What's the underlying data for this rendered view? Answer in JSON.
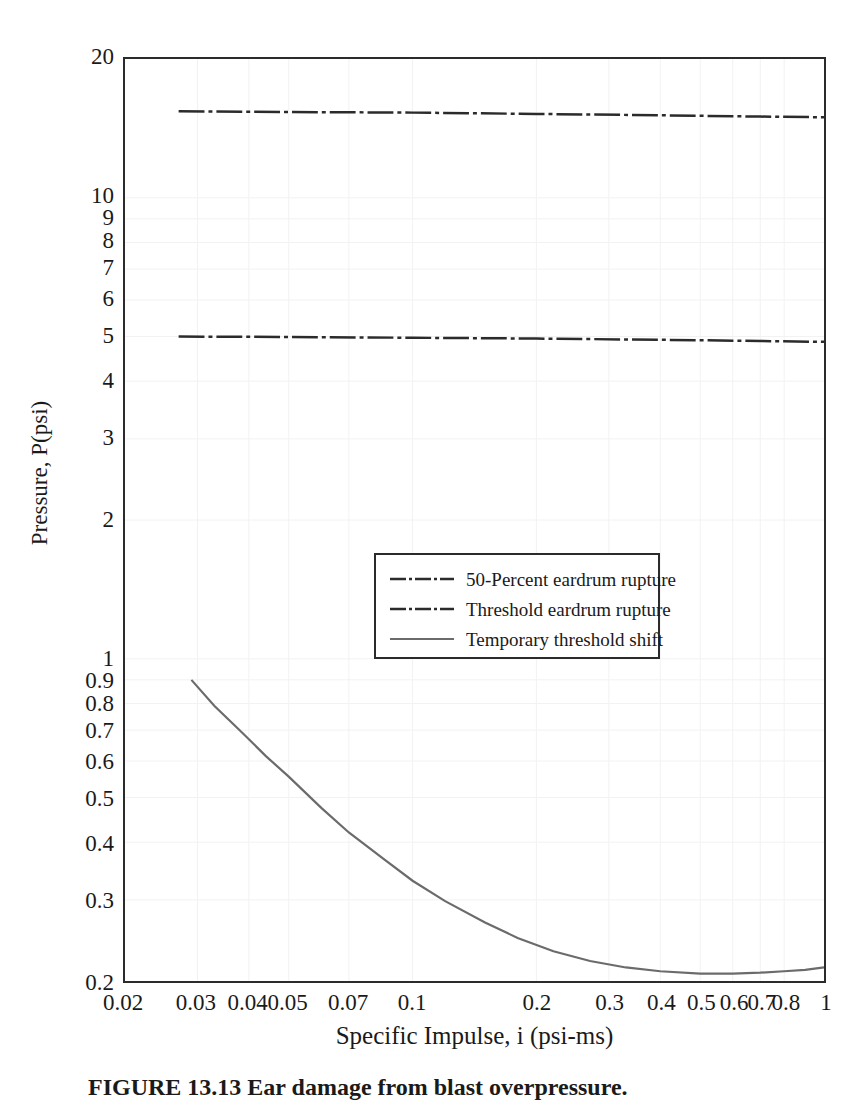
{
  "figure": {
    "caption": "FIGURE 13.13  Ear damage from blast overpressure."
  },
  "chart_data": {
    "type": "line",
    "title": "",
    "xlabel": "Specific Impulse, i (psi-ms)",
    "ylabel": "Pressure, P(psi)",
    "xscale": "log",
    "yscale": "log",
    "xlim": [
      0.02,
      1
    ],
    "ylim": [
      0.2,
      20
    ],
    "grid": true,
    "legend_position": "center",
    "xticks": [
      "0.02",
      "0.03",
      "0.04",
      "0.05",
      "0.07",
      "0.1",
      "0.2",
      "0.3",
      "0.4",
      "0.5",
      "0.6",
      "0.7",
      "0.8",
      "1"
    ],
    "xtick_values": [
      0.02,
      0.03,
      0.04,
      0.05,
      0.07,
      0.1,
      0.2,
      0.3,
      0.4,
      0.5,
      0.6,
      0.7,
      0.8,
      1
    ],
    "yticks": [
      "20",
      "10",
      "9",
      "8",
      "7",
      "6",
      "5",
      "4",
      "3",
      "2",
      "1",
      "0.9",
      "0.8",
      "0.7",
      "0.6",
      "0.5",
      "0.4",
      "0.3",
      "0.2"
    ],
    "ytick_values": [
      20,
      10,
      9,
      8,
      7,
      6,
      5,
      4,
      3,
      2,
      1,
      0.9,
      0.8,
      0.7,
      0.6,
      0.5,
      0.4,
      0.3,
      0.2
    ],
    "series": [
      {
        "name": "50-Percent eardrum rupture",
        "style": "dash-dot",
        "color": "#2b2b2b",
        "width": 2.5,
        "x": [
          0.027,
          0.05,
          0.1,
          0.2,
          0.4,
          0.7,
          1.0
        ],
        "y": [
          15.4,
          15.35,
          15.3,
          15.2,
          15.1,
          15.0,
          14.95
        ]
      },
      {
        "name": "Threshold eardrum rupture",
        "style": "dash-dot",
        "color": "#2b2b2b",
        "width": 2.5,
        "x": [
          0.027,
          0.05,
          0.1,
          0.2,
          0.4,
          0.7,
          1.0
        ],
        "y": [
          5.0,
          4.99,
          4.97,
          4.95,
          4.92,
          4.89,
          4.87
        ]
      },
      {
        "name": "Temporary threshold shift",
        "style": "solid",
        "color": "#6b6b6b",
        "width": 2.2,
        "x": [
          0.029,
          0.033,
          0.038,
          0.044,
          0.05,
          0.06,
          0.07,
          0.085,
          0.1,
          0.12,
          0.15,
          0.18,
          0.22,
          0.27,
          0.33,
          0.4,
          0.5,
          0.6,
          0.7,
          0.8,
          0.9,
          1.0
        ],
        "y": [
          0.9,
          0.79,
          0.7,
          0.615,
          0.555,
          0.475,
          0.42,
          0.368,
          0.33,
          0.298,
          0.268,
          0.248,
          0.232,
          0.221,
          0.214,
          0.21,
          0.2075,
          0.2075,
          0.2085,
          0.21,
          0.2115,
          0.214
        ]
      }
    ]
  },
  "axis": {
    "x_title": "Specific Impulse, i (psi-ms)",
    "y_title": "Pressure, P(psi)"
  },
  "legend": {
    "items": [
      {
        "label": "50-Percent eardrum rupture",
        "style": "dash-dot",
        "color": "#2b2b2b"
      },
      {
        "label": "Threshold eardrum rupture",
        "style": "dash-dot",
        "color": "#2b2b2b"
      },
      {
        "label": "Temporary threshold shift",
        "style": "solid",
        "color": "#6b6b6b"
      }
    ]
  },
  "colors": {
    "frame": "#2b2b2b",
    "grid": "#f2f2f2",
    "text": "#1a1a1a",
    "curve": "#6b6b6b",
    "background": "#ffffff"
  }
}
